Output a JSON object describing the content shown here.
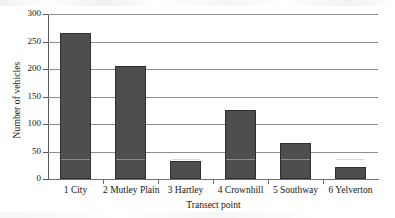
{
  "chart_data": {
    "type": "bar",
    "title": "",
    "xlabel": "Transect point",
    "ylabel": "Number of vehicles",
    "categories": [
      "1 City",
      "2 Mutley Plain",
      "3 Hartley",
      "4 Crownhill",
      "5 Southway",
      "6 Yelverton"
    ],
    "values": [
      265,
      205,
      32,
      125,
      66,
      22
    ],
    "ylim": [
      0,
      300
    ],
    "yticks": [
      0,
      50,
      100,
      150,
      200,
      250,
      300
    ],
    "ytick_labels": [
      "0",
      "50",
      "100",
      "150",
      "200",
      "250",
      "300"
    ],
    "grid": true,
    "legend": "none",
    "bar_color": "#4e4e4e",
    "bar_edge_color": "#2f2f2f",
    "gridline_color": "#8e8e8e",
    "axis_color": "#6f6f6f",
    "background_color": "#ffffff"
  }
}
